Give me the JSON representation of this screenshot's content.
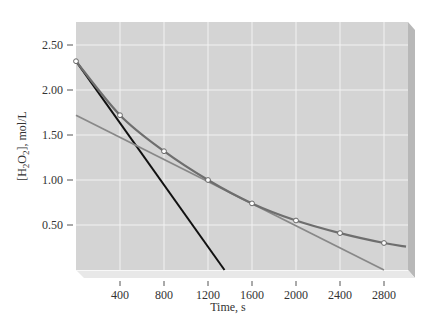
{
  "chart_data": {
    "type": "line",
    "title": "",
    "xlabel": "Time, s",
    "ylabel": "[H2O2], mol/L",
    "ylabel_parts": {
      "open": "[H",
      "sub1": "2",
      "mid": "O",
      "sub2": "2",
      "close": "], mol/L"
    },
    "xlim": [
      0,
      3000
    ],
    "ylim": [
      0,
      2.75
    ],
    "x_ticks": [
      400,
      800,
      1200,
      1600,
      2000,
      2400,
      2800
    ],
    "x_tick_labels": [
      "400",
      "800",
      "1200",
      "1600",
      "2000",
      "2400",
      "2800"
    ],
    "y_ticks": [
      0.5,
      1.0,
      1.5,
      2.0,
      2.5
    ],
    "y_tick_labels": [
      "0.50",
      "1.00",
      "1.50",
      "2.00",
      "2.50"
    ],
    "grid": true,
    "legend": null,
    "series": [
      {
        "name": "[H2O2] decay curve",
        "kind": "curve-with-markers",
        "color": "#6e6e6e",
        "x": [
          0,
          400,
          800,
          1200,
          1600,
          2000,
          2400,
          2800,
          3000
        ],
        "y": [
          2.32,
          1.72,
          1.32,
          1.0,
          0.74,
          0.55,
          0.41,
          0.3,
          0.26
        ],
        "markers_x": [
          0,
          400,
          800,
          1200,
          1600,
          2000,
          2400,
          2800
        ]
      },
      {
        "name": "tangent at t=0 (initial rate)",
        "kind": "line",
        "color": "#111111",
        "x": [
          0,
          1350
        ],
        "y": [
          2.32,
          0.0
        ]
      },
      {
        "name": "tangent at t=1200 s",
        "kind": "line",
        "color": "#888888",
        "x": [
          0,
          2800
        ],
        "y": [
          1.72,
          0.0
        ]
      }
    ]
  },
  "colors": {
    "plot_background": "#d4d4d4",
    "grid": "#f2f2f2",
    "side_panel": "#b8b8b8",
    "bottom_panel": "#e6e6e6",
    "marker_fill": "#ffffff"
  }
}
